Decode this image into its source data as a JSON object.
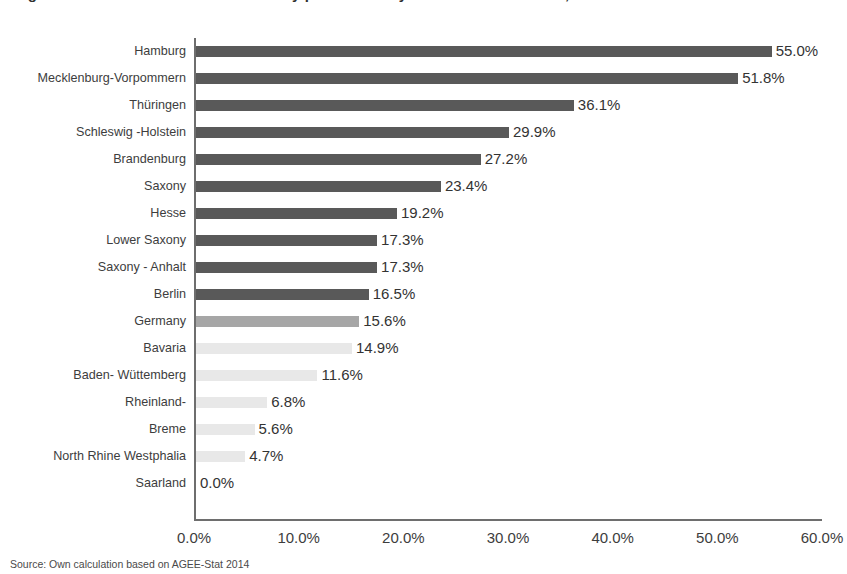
{
  "title": "Figure 1. Share of renewable electricity production by German federal state, 2013",
  "source_note": "Source: Own calculation based on AGEE-Stat 2014",
  "chart_data": {
    "type": "bar",
    "orientation": "horizontal",
    "title": "Figure 1. Share of renewable electricity production by German federal state, 2013",
    "xlabel": "",
    "ylabel": "",
    "xlim": [
      0,
      60
    ],
    "xticks": [
      "0.0%",
      "10.0%",
      "20.0%",
      "30.0%",
      "40.0%",
      "50.0%",
      "60.0%"
    ],
    "xtick_values": [
      0,
      10,
      20,
      30,
      40,
      50,
      60
    ],
    "grid": false,
    "legend": "none",
    "categories": [
      "Hamburg",
      "Mecklenburg-Vorpommern",
      "Thüringen",
      "Schleswig -Holstein",
      "Brandenburg",
      "Saxony",
      "Hesse",
      "Lower Saxony",
      "Saxony - Anhalt",
      "Berlin",
      "Germany",
      "Bavaria",
      "Baden- Wüttemberg",
      "Rheinland-",
      "Breme",
      "North Rhine Westphalia",
      "Saarland"
    ],
    "values": [
      55.0,
      51.8,
      36.1,
      29.9,
      27.2,
      23.4,
      19.2,
      17.3,
      17.3,
      16.5,
      15.6,
      14.9,
      11.6,
      6.8,
      5.6,
      4.7,
      0.0
    ],
    "value_labels": [
      "55.0%",
      "51.8%",
      "36.1%",
      "29.9%",
      "27.2%",
      "23.4%",
      "19.2%",
      "17.3%",
      "17.3%",
      "16.5%",
      "15.6%",
      "14.9%",
      "11.6%",
      "6.8%",
      "5.6%",
      "4.7%",
      "0.0%"
    ],
    "bar_colors": [
      "#595959",
      "#595959",
      "#595959",
      "#595959",
      "#595959",
      "#595959",
      "#595959",
      "#595959",
      "#595959",
      "#595959",
      "#a6a6a6",
      "#e8e8e8",
      "#e8e8e8",
      "#e8e8e8",
      "#e8e8e8",
      "#e8e8e8",
      "#e8e8e8"
    ],
    "colors": {
      "dark": "#595959",
      "mid": "#a6a6a6",
      "light": "#e8e8e8",
      "axis": "#6e6e6e",
      "text": "#3d3d3d"
    }
  }
}
